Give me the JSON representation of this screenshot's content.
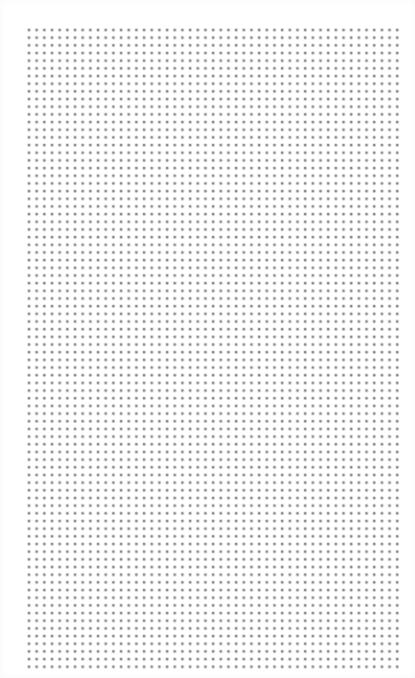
{
  "page": {
    "type": "dot-grid-paper",
    "background_color": "#ffffff",
    "dot_color": "#787878"
  },
  "grid": {
    "columns": 49,
    "rows": 84,
    "spacing_px": 7.68,
    "origin_px": [
      29,
      29.5
    ]
  }
}
